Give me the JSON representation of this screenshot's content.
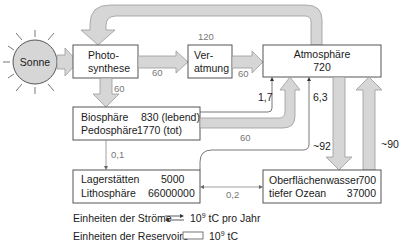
{
  "diagram": {
    "nodes": {
      "sun": {
        "label": "Sonne"
      },
      "photosynthesis": {
        "line1": "Photo-",
        "line2": "synthese"
      },
      "respiration": {
        "line1": "Ver-",
        "line2": "atmung"
      },
      "atmosphere": {
        "label": "Atmosphäre",
        "value": "720"
      },
      "biosphere": {
        "row1_label": "Biosphäre",
        "row1_value": "830 (lebend)",
        "row2_label": "Pedosphäre",
        "row2_value": "1770 (tot)"
      },
      "lithosphere": {
        "row1_label": "Lagerstätten",
        "row1_value": "5000",
        "row2_label": "Lithosphäre",
        "row2_value": "66000000"
      },
      "ocean": {
        "row1_label": "Oberflächenwasser",
        "row1_value": "700",
        "row2_label": "tiefer Ozean",
        "row2_value": "37000"
      }
    },
    "flows": {
      "atmosphere_to_photosynthesis": "120",
      "photosynthesis_to_respiration": "60",
      "respiration_to_atmosphere": "60",
      "photosynthesis_to_biosphere": "60",
      "biosphere_to_atmosphere": "60",
      "biosphere_to_lithosphere": "0,1",
      "lithosphere_to_atmosphere": "1,7",
      "ocean_lithosphere_exchange": "0,2",
      "lithosphere_to_atmosphere_2": "6,3",
      "atmosphere_to_ocean": "~92",
      "ocean_to_atmosphere": "~90"
    },
    "legend": {
      "flows_label": "Einheiten der Ströme",
      "flows_unit_base": "10",
      "flows_unit_exp": "9",
      "flows_unit_rest": " tC pro Jahr",
      "reservoir_label": "Einheiten der Reservoire",
      "reservoir_unit_base": "10",
      "reservoir_unit_exp": "9",
      "reservoir_unit_rest": " tC"
    },
    "colors": {
      "flow_fill": "#d6d6d6",
      "sun_fill": "#d6d6d6",
      "box_stroke": "#555555"
    }
  }
}
